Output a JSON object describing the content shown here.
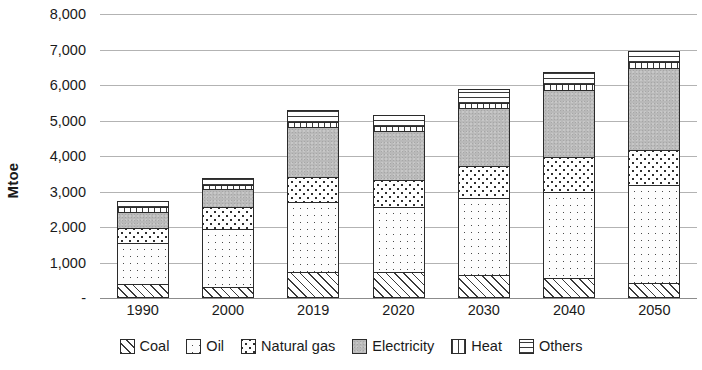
{
  "chart_data": {
    "type": "bar",
    "stacked": true,
    "title": "",
    "xlabel": "",
    "ylabel": "Mtoe",
    "ylim": [
      0,
      8000
    ],
    "ytick_values": [
      0,
      1000,
      2000,
      3000,
      4000,
      5000,
      6000,
      7000,
      8000
    ],
    "ytick_labels": [
      "-",
      "1,000",
      "2,000",
      "3,000",
      "4,000",
      "5,000",
      "6,000",
      "7,000",
      "8,000"
    ],
    "grid": true,
    "legend_position": "bottom",
    "categories": [
      "1990",
      "2000",
      "2019",
      "2020",
      "2030",
      "2040",
      "2050"
    ],
    "series": [
      {
        "name": "Coal",
        "pattern": "diagonal-hatch",
        "color": "#ffffff",
        "values": [
          400,
          310,
          730,
          740,
          650,
          570,
          420
        ]
      },
      {
        "name": "Oil",
        "pattern": "sparse-dots",
        "color": "#fdfdfd",
        "values": [
          1150,
          1640,
          1980,
          1830,
          2170,
          2420,
          2760
        ]
      },
      {
        "name": "Natural gas",
        "pattern": "checkerboard",
        "color": "#ffffff",
        "values": [
          420,
          620,
          700,
          760,
          900,
          980,
          990
        ]
      },
      {
        "name": "Electricity",
        "pattern": "solid-grey",
        "color": "#b9b9b9",
        "values": [
          450,
          500,
          1410,
          1380,
          1630,
          1890,
          2310
        ]
      },
      {
        "name": "Heat",
        "pattern": "vertical-bars",
        "color": "#ffffff",
        "values": [
          130,
          110,
          130,
          130,
          150,
          160,
          170
        ]
      },
      {
        "name": "Others",
        "pattern": "horizontal-lines",
        "color": "#ffffff",
        "values": [
          180,
          210,
          350,
          310,
          400,
          360,
          300
        ]
      }
    ],
    "totals": [
      2730,
      3390,
      5300,
      5150,
      5900,
      6380,
      6950
    ]
  },
  "legend": {
    "items": [
      {
        "label": "Coal"
      },
      {
        "label": "Oil"
      },
      {
        "label": "Natural gas"
      },
      {
        "label": "Electricity"
      },
      {
        "label": "Heat"
      },
      {
        "label": "Others"
      }
    ]
  }
}
